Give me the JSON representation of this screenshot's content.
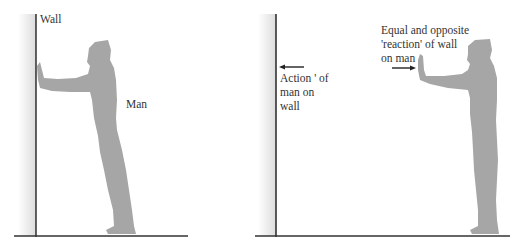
{
  "figure": {
    "left_panel": {
      "wall_label": "Wall",
      "man_label": "Man"
    },
    "right_panel": {
      "action_label_lines": [
        "Action ' of",
        "man on",
        "wall"
      ],
      "reaction_label_lines": [
        "Equal and opposite",
        "'reaction' of wall",
        "on man"
      ]
    },
    "colors": {
      "silhouette": "#a6a6a6",
      "line": "#222222",
      "wall_shade": "#e6e6e6"
    }
  }
}
